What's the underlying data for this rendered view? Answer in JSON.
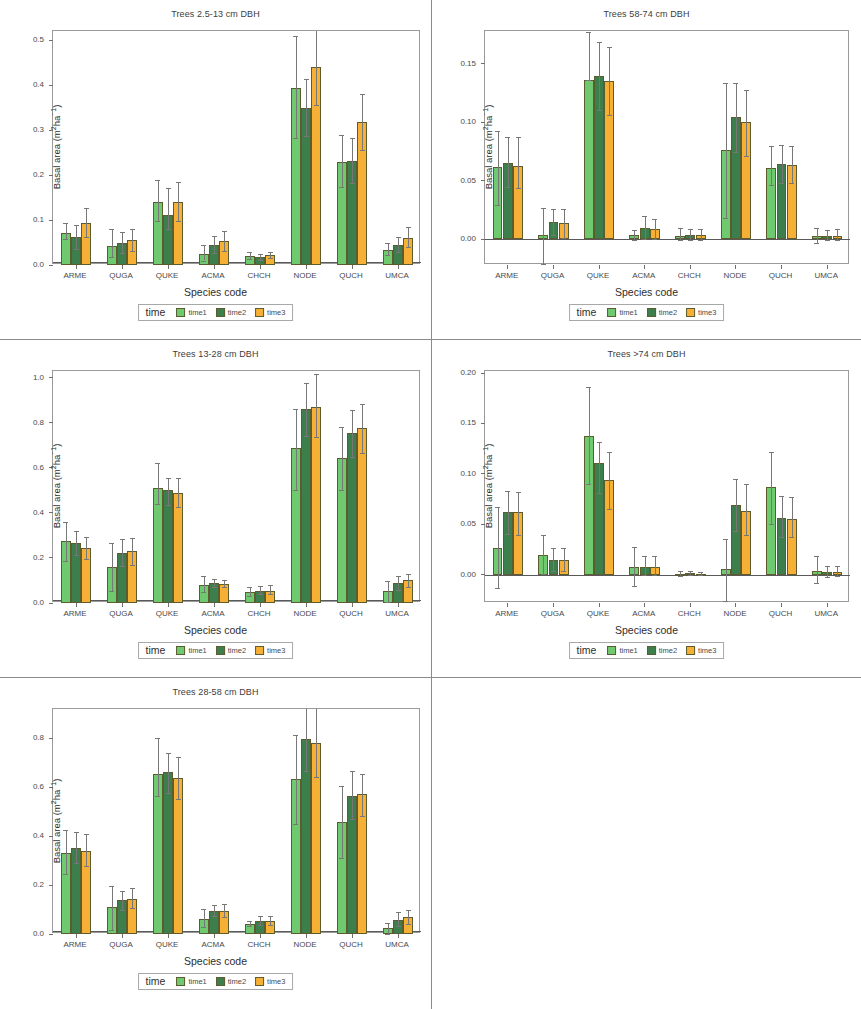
{
  "figure": {
    "y_axis_label": "Basal area (m²ha⁻¹)",
    "x_axis_label": "Species code",
    "legend_title": "time",
    "series_names": [
      "time1",
      "time2",
      "time3"
    ],
    "colors": {
      "time1": "#6fc96f",
      "time2": "#3d7f4c",
      "time3": "#f7b036",
      "bar_outline": "#5c5c2e",
      "error_bar": "#777777",
      "panel_border": "#8a8a8a",
      "plot_border": "#9a9a9a",
      "text": "#3a3a3a"
    }
  },
  "chart_data": [
    {
      "type": "bar",
      "title": "Trees 2.5-13 cm DBH",
      "xlabel": "Species code",
      "ylabel": "Basal area (m²ha⁻¹)",
      "ylim": [
        0.0,
        0.52
      ],
      "yticks": [
        0.0,
        0.1,
        0.2,
        0.3,
        0.4,
        0.5
      ],
      "ytick_labels": [
        "0.0",
        "0.1",
        "0.2",
        "0.3",
        "0.4",
        "0.5"
      ],
      "categories": [
        "ARME",
        "QUGA",
        "QUKE",
        "ACMA",
        "CHCH",
        "NODE",
        "QUCH",
        "UMCA"
      ],
      "grid": false,
      "legend_position": "below",
      "series": [
        {
          "name": "time1",
          "values": [
            0.072,
            0.042,
            0.139,
            0.025,
            0.021,
            0.394,
            0.229,
            0.034
          ],
          "err_low": [
            0.058,
            0.018,
            0.097,
            0.01,
            0.014,
            0.282,
            0.173,
            0.023
          ],
          "err_high": [
            0.094,
            0.08,
            0.188,
            0.044,
            0.029,
            0.509,
            0.288,
            0.049
          ]
        },
        {
          "name": "time2",
          "values": [
            0.062,
            0.05,
            0.112,
            0.045,
            0.018,
            0.35,
            0.232,
            0.044
          ],
          "err_low": [
            0.035,
            0.026,
            0.081,
            0.026,
            0.012,
            0.287,
            0.182,
            0.028
          ],
          "err_high": [
            0.089,
            0.074,
            0.172,
            0.064,
            0.024,
            0.414,
            0.283,
            0.063
          ]
        },
        {
          "name": "time3",
          "values": [
            0.094,
            0.055,
            0.14,
            0.053,
            0.022,
            0.439,
            0.318,
            0.061
          ],
          "err_low": [
            0.062,
            0.031,
            0.097,
            0.032,
            0.015,
            0.356,
            0.255,
            0.039
          ],
          "err_high": [
            0.126,
            0.08,
            0.185,
            0.075,
            0.029,
            0.523,
            0.381,
            0.085
          ]
        }
      ]
    },
    {
      "type": "bar",
      "title": "Trees 58-74 cm DBH",
      "xlabel": "Species code",
      "ylabel": "Basal area (m²ha⁻¹)",
      "ylim": [
        -0.022,
        0.178
      ],
      "yticks": [
        0.0,
        0.05,
        0.1,
        0.15
      ],
      "ytick_labels": [
        "0.00",
        "0.05",
        "0.10",
        "0.15"
      ],
      "categories": [
        "ARME",
        "QUGA",
        "QUKE",
        "ACMA",
        "CHCH",
        "NODE",
        "QUCH",
        "UMCA"
      ],
      "grid": false,
      "legend_position": "below",
      "series": [
        {
          "name": "time1",
          "values": [
            0.0615,
            0.0035,
            0.1365,
            0.0035,
            0.0025,
            0.0765,
            0.0605,
            0.0025
          ],
          "err_low": [
            0.0295,
            -0.0215,
            0.1365,
            -0.0005,
            -0.0005,
            0.0185,
            0.0465,
            -0.0035
          ],
          "err_high": [
            0.0925,
            0.0265,
            0.1775,
            0.0075,
            0.0095,
            0.1335,
            0.0795,
            0.0095
          ]
        },
        {
          "name": "time2",
          "values": [
            0.0655,
            0.0145,
            0.1395,
            0.0095,
            0.0035,
            0.1045,
            0.0645,
            0.0025
          ],
          "err_low": [
            0.0445,
            0.0035,
            0.1105,
            0.0005,
            -0.0005,
            0.0745,
            0.0485,
            -0.0005
          ],
          "err_high": [
            0.0875,
            0.0255,
            0.1685,
            0.0195,
            0.0085,
            0.1335,
            0.0805,
            0.0075
          ]
        },
        {
          "name": "time3",
          "values": [
            0.0625,
            0.0135,
            0.1355,
            0.0085,
            0.0035,
            0.1005,
            0.0635,
            0.0025
          ],
          "err_low": [
            0.0435,
            0.0015,
            0.1065,
            0.0005,
            -0.0005,
            0.0715,
            0.0485,
            -0.0005
          ],
          "err_high": [
            0.0875,
            0.0255,
            0.1645,
            0.0175,
            0.0085,
            0.1275,
            0.0795,
            0.0085
          ]
        }
      ]
    },
    {
      "type": "bar",
      "title": "Trees 13-28 cm DBH",
      "xlabel": "Species code",
      "ylabel": "Basal area (m²ha⁻¹)",
      "ylim": [
        0.0,
        1.03
      ],
      "yticks": [
        0.0,
        0.2,
        0.4,
        0.6,
        0.8,
        1.0
      ],
      "ytick_labels": [
        "0.0",
        "0.2",
        "0.4",
        "0.6",
        "0.8",
        "1.0"
      ],
      "categories": [
        "ARME",
        "QUGA",
        "QUKE",
        "ACMA",
        "CHCH",
        "NODE",
        "QUCH",
        "UMCA"
      ],
      "grid": false,
      "legend_position": "below",
      "series": [
        {
          "name": "time1",
          "values": [
            0.275,
            0.16,
            0.51,
            0.08,
            0.047,
            0.688,
            0.643,
            0.055
          ],
          "err_low": [
            0.186,
            0.053,
            0.44,
            0.048,
            0.029,
            0.5,
            0.5,
            0.006
          ],
          "err_high": [
            0.36,
            0.268,
            0.62,
            0.118,
            0.07,
            0.862,
            0.782,
            0.098
          ]
        },
        {
          "name": "time2",
          "values": [
            0.265,
            0.223,
            0.5,
            0.088,
            0.054,
            0.862,
            0.755,
            0.088
          ],
          "err_low": [
            0.215,
            0.163,
            0.435,
            0.07,
            0.038,
            0.74,
            0.65,
            0.058
          ],
          "err_high": [
            0.318,
            0.283,
            0.555,
            0.108,
            0.075,
            0.975,
            0.858,
            0.118
          ]
        },
        {
          "name": "time3",
          "values": [
            0.243,
            0.23,
            0.488,
            0.085,
            0.055,
            0.87,
            0.775,
            0.1
          ],
          "err_low": [
            0.195,
            0.168,
            0.425,
            0.07,
            0.04,
            0.735,
            0.668,
            0.072
          ],
          "err_high": [
            0.292,
            0.288,
            0.553,
            0.1,
            0.078,
            1.015,
            0.883,
            0.13
          ]
        }
      ]
    },
    {
      "type": "bar",
      "title": "Trees >74 cm DBH",
      "xlabel": "Species code",
      "ylabel": "Basal area (m²ha⁻¹)",
      "ylim": [
        -0.028,
        0.202
      ],
      "yticks": [
        0.0,
        0.05,
        0.1,
        0.15,
        0.2
      ],
      "ytick_labels": [
        "0.00",
        "0.05",
        "0.10",
        "0.15",
        "0.20"
      ],
      "categories": [
        "ARME",
        "QUGA",
        "QUKE",
        "ACMA",
        "CHCH",
        "NODE",
        "QUCH",
        "UMCA"
      ],
      "grid": false,
      "legend_position": "below",
      "series": [
        {
          "name": "time1",
          "values": [
            0.0265,
            0.0195,
            0.138,
            0.0075,
            0.0005,
            0.0055,
            0.087,
            0.004
          ],
          "err_low": [
            -0.0135,
            0.0005,
            0.0895,
            -0.0115,
            -0.0015,
            -0.0265,
            0.0505,
            -0.0085
          ],
          "err_high": [
            0.067,
            0.039,
            0.186,
            0.0275,
            0.0035,
            0.0355,
            0.1215,
            0.019
          ]
        },
        {
          "name": "time2",
          "values": [
            0.062,
            0.0145,
            0.1105,
            0.008,
            0.0015,
            0.069,
            0.0565,
            0.0025
          ],
          "err_low": [
            0.0405,
            0.0035,
            0.081,
            -0.0005,
            -0.0005,
            0.0435,
            0.037,
            -0.0025
          ],
          "err_high": [
            0.0835,
            0.0265,
            0.132,
            0.0185,
            0.0035,
            0.095,
            0.078,
            0.0085
          ]
        },
        {
          "name": "time3",
          "values": [
            0.062,
            0.0145,
            0.094,
            0.008,
            0.001,
            0.063,
            0.0555,
            0.003
          ],
          "err_low": [
            0.0395,
            0.0035,
            0.0655,
            -0.0005,
            -0.0005,
            0.039,
            0.037,
            -0.0015
          ],
          "err_high": [
            0.0825,
            0.0265,
            0.1215,
            0.0185,
            0.003,
            0.09,
            0.0775,
            0.009
          ]
        }
      ]
    },
    {
      "type": "bar",
      "title": "Trees 28-58 cm DBH",
      "xlabel": "Species code",
      "ylabel": "Basal area (m²ha⁻¹)",
      "ylim": [
        0.0,
        0.92
      ],
      "yticks": [
        0.0,
        0.2,
        0.4,
        0.6,
        0.8
      ],
      "ytick_labels": [
        "0.0",
        "0.2",
        "0.4",
        "0.6",
        "0.8"
      ],
      "categories": [
        "ARME",
        "QUGA",
        "QUKE",
        "ACMA",
        "CHCH",
        "NODE",
        "QUCH",
        "UMCA"
      ],
      "grid": false,
      "legend_position": "below",
      "series": [
        {
          "name": "time1",
          "values": [
            0.33,
            0.112,
            0.653,
            0.062,
            0.042,
            0.635,
            0.458,
            0.025
          ],
          "err_low": [
            0.245,
            0.018,
            0.565,
            0.03,
            0.032,
            0.448,
            0.31,
            0.002
          ],
          "err_high": [
            0.425,
            0.198,
            0.8,
            0.102,
            0.055,
            0.812,
            0.605,
            0.045
          ]
        },
        {
          "name": "time2",
          "values": [
            0.352,
            0.138,
            0.662,
            0.095,
            0.055,
            0.798,
            0.565,
            0.058
          ],
          "err_low": [
            0.29,
            0.098,
            0.578,
            0.072,
            0.038,
            0.665,
            0.47,
            0.032
          ],
          "err_high": [
            0.418,
            0.175,
            0.742,
            0.12,
            0.075,
            0.928,
            0.665,
            0.09
          ]
        },
        {
          "name": "time3",
          "values": [
            0.338,
            0.145,
            0.638,
            0.095,
            0.052,
            0.782,
            0.572,
            0.068
          ],
          "err_low": [
            0.278,
            0.108,
            0.55,
            0.07,
            0.035,
            0.64,
            0.482,
            0.042
          ],
          "err_high": [
            0.41,
            0.188,
            0.722,
            0.122,
            0.075,
            0.922,
            0.655,
            0.098
          ]
        }
      ]
    }
  ]
}
